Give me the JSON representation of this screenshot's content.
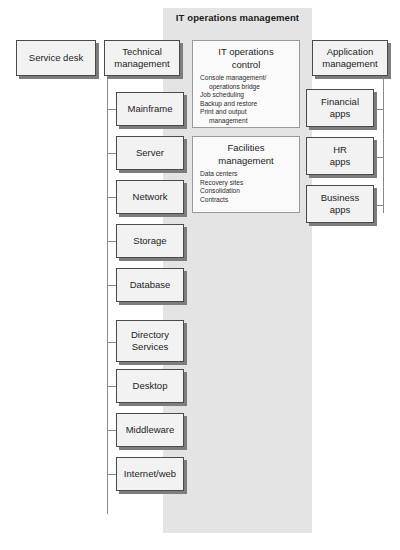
{
  "band": {
    "title": "IT operations management"
  },
  "top_boxes": [
    {
      "name": "service-desk",
      "label": "Service desk"
    },
    {
      "name": "technical-management",
      "label": "Technical\nmanagement"
    },
    {
      "name": "application-management",
      "label": "Application\nmanagement"
    }
  ],
  "technical_management": {
    "children": [
      {
        "label": "Mainframe"
      },
      {
        "label": "Server"
      },
      {
        "label": "Network"
      },
      {
        "label": "Storage"
      },
      {
        "label": "Database"
      },
      {
        "label": "Directory\nServices"
      },
      {
        "label": "Desktop"
      },
      {
        "label": "Middleware"
      },
      {
        "label": "Internet/web"
      }
    ]
  },
  "application_management": {
    "children": [
      {
        "label": "Financial\napps"
      },
      {
        "label": "HR\napps"
      },
      {
        "label": "Business\napps"
      }
    ]
  },
  "panels": [
    {
      "name": "it-operations-control",
      "title": "IT operations\ncontrol",
      "items": [
        "Console management/",
        "operations bridge",
        "Job scheduling",
        "Backup and restore",
        "Print and output",
        "management"
      ],
      "indented": [
        false,
        true,
        false,
        false,
        false,
        true
      ]
    },
    {
      "name": "facilities-management",
      "title": "Facilities\nmanagement",
      "items": [
        "Data centers",
        "Recovery sites",
        "Consolidation",
        "Contracts"
      ],
      "indented": [
        false,
        false,
        false,
        false
      ]
    }
  ],
  "colors": {
    "band": "#e4e4e4",
    "box_fill": "#f2f2f2",
    "box_border": "#4a4a4a",
    "shadow": "#7d7d7d",
    "line": "#8a8a8a"
  }
}
